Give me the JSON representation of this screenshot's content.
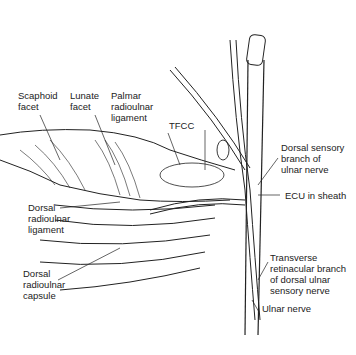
{
  "figure": {
    "labels": {
      "scaphoid_facet": "Scaphoid\nfacet",
      "lunate_facet": "Lunate\nfacet",
      "palmar_radioulnar_ligament": "Palmar\nradioulnar\nligament",
      "tfcc": "TFCC",
      "dorsal_sensory_branch": "Dorsal sensory\nbranch of\nulnar nerve",
      "ecu_in_sheath": "ECU in sheath",
      "dorsal_radioulnar_ligament": "Dorsal\nradioulnar\nligament",
      "dorsal_radioulnar_capsule": "Dorsal\nradioulnar\ncapsule",
      "transverse_retinacular_branch": "Transverse\nretinacular branch\nof dorsal ulnar\nsensory nerve",
      "ulnar_nerve": "Ulnar nerve"
    },
    "colors": {
      "line": "#222222",
      "background": "#ffffff"
    }
  }
}
